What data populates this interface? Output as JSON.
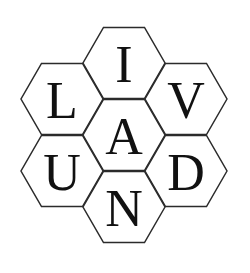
{
  "figure": {
    "name": "hexagon-letter-logo",
    "word": "LIVANDU",
    "background_color": "#ffffff",
    "stroke_color": "#2b2b2b",
    "letter_color": "#111111",
    "stroke_width": 1.5,
    "canvas": {
      "width": 250,
      "height": 273
    },
    "layout": "honeycomb-7-flat-top",
    "hex_radius": 41,
    "cells": [
      {
        "id": "hex-top",
        "position": "top",
        "letter": "I",
        "cx": 124,
        "cy": 63,
        "font_size": 52
      },
      {
        "id": "hex-upper-left",
        "position": "upper-left",
        "letter": "L",
        "cx": 62,
        "cy": 99,
        "font_size": 52
      },
      {
        "id": "hex-upper-right",
        "position": "upper-right",
        "letter": "V",
        "cx": 186,
        "cy": 99,
        "font_size": 52
      },
      {
        "id": "hex-center",
        "position": "center",
        "letter": "A",
        "cx": 124,
        "cy": 135,
        "font_size": 52
      },
      {
        "id": "hex-lower-left",
        "position": "lower-left",
        "letter": "U",
        "cx": 62,
        "cy": 171,
        "font_size": 52
      },
      {
        "id": "hex-lower-right",
        "position": "lower-right",
        "letter": "D",
        "cx": 186,
        "cy": 171,
        "font_size": 52
      },
      {
        "id": "hex-bottom",
        "position": "bottom",
        "letter": "N",
        "cx": 124,
        "cy": 207,
        "font_size": 52
      }
    ]
  }
}
